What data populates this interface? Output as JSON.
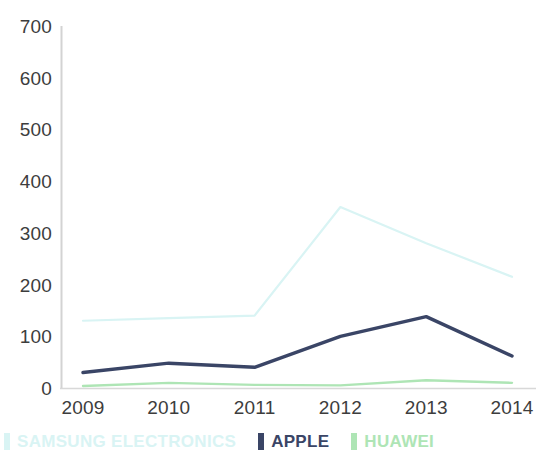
{
  "chart_data": {
    "type": "line",
    "title": "",
    "subtitle": "",
    "xlabel": "",
    "ylabel": "",
    "categories": [
      "2009",
      "2010",
      "2011",
      "2012",
      "2013",
      "2014"
    ],
    "x": [
      2009,
      2010,
      2011,
      2012,
      2013,
      2014
    ],
    "ylim": [
      0,
      700
    ],
    "yticks": [
      0,
      100,
      200,
      300,
      400,
      500,
      600,
      700
    ],
    "ytick_labels": [
      "0",
      "100",
      "200",
      "300",
      "400",
      "500",
      "600",
      "700"
    ],
    "grid": false,
    "legend_position": "bottom-left",
    "series": [
      {
        "name": "SAMSUNG ELECTRONICS",
        "color": "#d9f4f4",
        "values": [
          130,
          135,
          140,
          350,
          280,
          215
        ]
      },
      {
        "name": "APPLE",
        "color": "#3a4566",
        "values": [
          30,
          48,
          40,
          100,
          138,
          62
        ]
      },
      {
        "name": "HUAWEI",
        "color": "#aee5b5",
        "values": [
          4,
          10,
          6,
          5,
          15,
          10
        ]
      }
    ]
  },
  "axes": {
    "y_tick_labels": [
      "700",
      "600",
      "500",
      "400",
      "300",
      "200",
      "100",
      "0"
    ],
    "x_tick_labels": [
      "2009",
      "2010",
      "2011",
      "2012",
      "2013",
      "2014"
    ],
    "axis_line_color": "#d0d0d0",
    "tick_text_color": "#3d3d3d"
  },
  "legend": {
    "items": [
      {
        "label": "SAMSUNG ELECTRONICS",
        "color": "#d9f4f4"
      },
      {
        "label": "APPLE",
        "color": "#3a4566"
      },
      {
        "label": "HUAWEI",
        "color": "#aee5b5"
      }
    ]
  }
}
